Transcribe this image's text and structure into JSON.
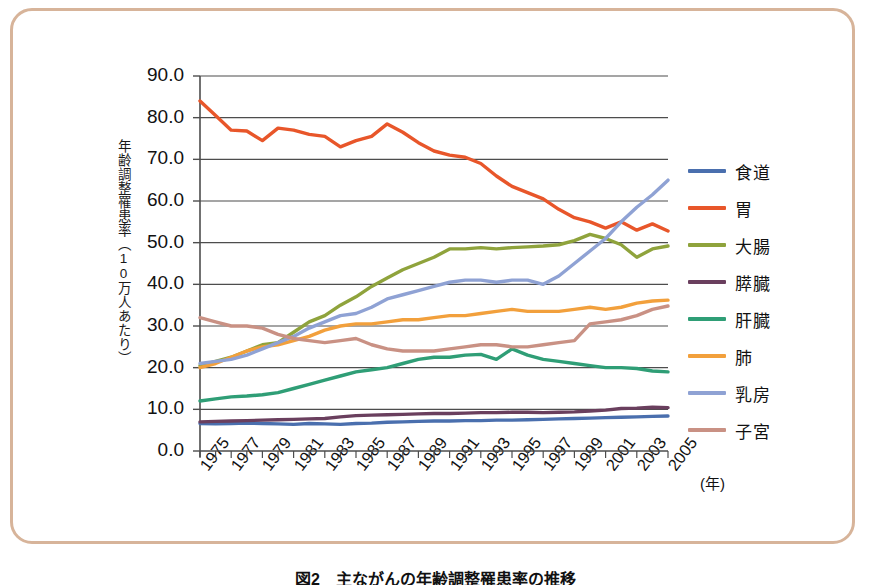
{
  "figure": {
    "caption": "図2　主ながんの年齢調整罹患率の推移",
    "border_color": "#d7b49a"
  },
  "axes": {
    "ylabel": "年齢調整罹患率（10万人あたり）",
    "xunit": "(年)",
    "yticks": [
      "0.0",
      "10.0",
      "20.0",
      "30.0",
      "40.0",
      "50.0",
      "60.0",
      "70.0",
      "80.0",
      "90.0"
    ],
    "xticks": [
      "1975",
      "1977",
      "1979",
      "1981",
      "1983",
      "1985",
      "1987",
      "1989",
      "1991",
      "1993",
      "1995",
      "1997",
      "1999",
      "2001",
      "2003",
      "2005"
    ]
  },
  "legend": {
    "items": [
      {
        "label": "食道",
        "color": "#4a6fae"
      },
      {
        "label": "胃",
        "color": "#e8562a"
      },
      {
        "label": "大腸",
        "color": "#8fa33c"
      },
      {
        "label": "膵臓",
        "color": "#6a3f5e"
      },
      {
        "label": "肝臓",
        "color": "#2f9e76"
      },
      {
        "label": "肺",
        "color": "#f2a03c"
      },
      {
        "label": "乳房",
        "color": "#8fa2d4"
      },
      {
        "label": "子宮",
        "color": "#c99184"
      }
    ]
  },
  "chart_data": {
    "type": "line",
    "title": "図2　主ながんの年齢調整罹患率の推移",
    "xlabel": "(年)",
    "ylabel": "年齢調整罹患率（10万人あたり）",
    "xlim": [
      1975,
      2005
    ],
    "ylim": [
      0,
      90
    ],
    "ytick_step": 10,
    "grid": true,
    "legend_position": "right",
    "x": [
      1975,
      1976,
      1977,
      1978,
      1979,
      1980,
      1981,
      1982,
      1983,
      1984,
      1985,
      1986,
      1987,
      1988,
      1989,
      1990,
      1991,
      1992,
      1993,
      1994,
      1995,
      1996,
      1997,
      1998,
      1999,
      2000,
      2001,
      2002,
      2003,
      2004,
      2005
    ],
    "series": [
      {
        "name": "食道",
        "color": "#4a6fae",
        "values": [
          6.6,
          6.5,
          6.6,
          6.7,
          6.6,
          6.5,
          6.4,
          6.6,
          6.5,
          6.4,
          6.6,
          6.7,
          6.9,
          7.0,
          7.1,
          7.2,
          7.2,
          7.3,
          7.3,
          7.4,
          7.4,
          7.5,
          7.6,
          7.7,
          7.8,
          7.9,
          8.0,
          8.1,
          8.2,
          8.3,
          8.4
        ]
      },
      {
        "name": "胃",
        "color": "#e8562a",
        "values": [
          84.0,
          80.5,
          77.0,
          76.8,
          74.5,
          77.5,
          77.0,
          76.0,
          75.5,
          73.0,
          74.5,
          75.5,
          78.5,
          76.5,
          74.0,
          72.0,
          71.0,
          70.5,
          69.0,
          66.0,
          63.5,
          62.0,
          60.5,
          58.0,
          56.0,
          55.0,
          53.5,
          55.0,
          53.0,
          54.5,
          52.8
        ]
      },
      {
        "name": "大腸",
        "color": "#8fa33c",
        "values": [
          20.5,
          21.5,
          22.5,
          24.0,
          25.5,
          26.0,
          28.5,
          31.0,
          32.5,
          35.0,
          37.0,
          39.5,
          41.5,
          43.5,
          45.0,
          46.5,
          48.5,
          48.5,
          48.8,
          48.5,
          48.8,
          49.0,
          49.2,
          49.5,
          50.5,
          52.0,
          51.0,
          49.5,
          46.5,
          48.5,
          49.2
        ]
      },
      {
        "name": "膵臓",
        "color": "#6a3f5e",
        "values": [
          7.0,
          7.1,
          7.2,
          7.3,
          7.4,
          7.5,
          7.6,
          7.7,
          7.8,
          8.2,
          8.5,
          8.6,
          8.7,
          8.8,
          8.9,
          9.0,
          9.0,
          9.1,
          9.2,
          9.2,
          9.3,
          9.3,
          9.2,
          9.3,
          9.4,
          9.6,
          9.8,
          10.2,
          10.3,
          10.5,
          10.4
        ]
      },
      {
        "name": "肝臓",
        "color": "#2f9e76",
        "values": [
          12.0,
          12.5,
          13.0,
          13.2,
          13.5,
          14.0,
          15.0,
          16.0,
          17.0,
          18.0,
          19.0,
          19.5,
          20.0,
          21.0,
          22.0,
          22.5,
          22.5,
          23.0,
          23.2,
          22.0,
          24.5,
          23.0,
          22.0,
          21.5,
          21.0,
          20.5,
          20.0,
          20.0,
          19.8,
          19.2,
          19.0
        ]
      },
      {
        "name": "肺",
        "color": "#f2a03c",
        "values": [
          20.0,
          21.0,
          22.5,
          24.0,
          25.0,
          25.5,
          26.5,
          27.5,
          29.0,
          30.0,
          30.5,
          30.5,
          31.0,
          31.5,
          31.5,
          32.0,
          32.5,
          32.5,
          33.0,
          33.5,
          34.0,
          33.5,
          33.5,
          33.5,
          34.0,
          34.5,
          34.0,
          34.5,
          35.5,
          36.0,
          36.2
        ]
      },
      {
        "name": "乳房",
        "color": "#8fa2d4",
        "values": [
          21.0,
          21.5,
          22.0,
          23.0,
          24.5,
          26.0,
          27.5,
          29.5,
          31.0,
          32.5,
          33.0,
          34.5,
          36.5,
          37.5,
          38.5,
          39.5,
          40.5,
          41.0,
          41.0,
          40.5,
          41.0,
          41.0,
          40.0,
          42.0,
          45.0,
          48.0,
          51.0,
          55.0,
          58.5,
          61.5,
          65.0
        ]
      },
      {
        "name": "子宮",
        "color": "#c99184",
        "values": [
          32.0,
          31.0,
          30.0,
          30.0,
          29.5,
          28.0,
          27.0,
          26.5,
          26.0,
          26.5,
          27.0,
          25.5,
          24.5,
          24.0,
          24.0,
          24.0,
          24.5,
          25.0,
          25.5,
          25.5,
          25.0,
          25.0,
          25.5,
          26.0,
          26.5,
          30.5,
          31.0,
          31.5,
          32.5,
          34.0,
          34.8
        ]
      }
    ]
  }
}
